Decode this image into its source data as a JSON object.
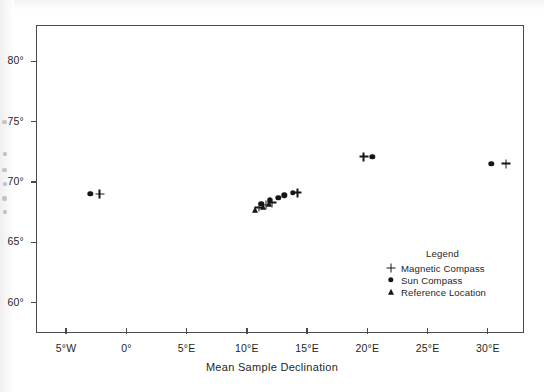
{
  "chart_data": {
    "type": "scatter",
    "title": "",
    "xlabel": "Mean Sample Declination",
    "ylabel": "",
    "xlim": [
      -7.5,
      33.0
    ],
    "ylim": [
      57.5,
      83.0
    ],
    "grid": false,
    "legend_position": "inside-lower-right",
    "x_ticks": [
      {
        "value": -5,
        "label": "5°W"
      },
      {
        "value": 0,
        "label": "0°"
      },
      {
        "value": 5,
        "label": "5°E"
      },
      {
        "value": 10,
        "label": "10°E"
      },
      {
        "value": 15,
        "label": "15°E"
      },
      {
        "value": 20,
        "label": "20°E"
      },
      {
        "value": 25,
        "label": "25°E"
      },
      {
        "value": 30,
        "label": "30°E"
      }
    ],
    "y_ticks": [
      {
        "value": 60,
        "label": "60°"
      },
      {
        "value": 65,
        "label": "65°"
      },
      {
        "value": 70,
        "label": "70°"
      },
      {
        "value": 75,
        "label": "75°"
      },
      {
        "value": 80,
        "label": "80°"
      }
    ],
    "series": [
      {
        "name": "Magnetic Compass",
        "marker": "plus",
        "color": "#161616",
        "points": [
          {
            "x": -2.2,
            "y": 69.0
          },
          {
            "x": 11.0,
            "y": 67.9
          },
          {
            "x": 11.6,
            "y": 68.1
          },
          {
            "x": 12.1,
            "y": 68.3
          },
          {
            "x": 14.2,
            "y": 69.1
          },
          {
            "x": 19.7,
            "y": 72.1
          },
          {
            "x": 31.5,
            "y": 71.5
          }
        ]
      },
      {
        "name": "Sun Compass",
        "marker": "circle",
        "color": "#161616",
        "points": [
          {
            "x": -3.0,
            "y": 69.0
          },
          {
            "x": 11.2,
            "y": 68.2
          },
          {
            "x": 11.9,
            "y": 68.5
          },
          {
            "x": 12.6,
            "y": 68.7
          },
          {
            "x": 13.1,
            "y": 68.9
          },
          {
            "x": 13.8,
            "y": 69.1
          },
          {
            "x": 20.4,
            "y": 72.1
          },
          {
            "x": 30.3,
            "y": 71.5
          }
        ]
      },
      {
        "name": "Reference Location",
        "marker": "triangle",
        "color": "#161616",
        "points": [
          {
            "x": 10.7,
            "y": 67.7
          },
          {
            "x": 11.3,
            "y": 67.9
          },
          {
            "x": 11.8,
            "y": 68.2
          }
        ]
      }
    ],
    "legend": {
      "title": "Legend",
      "entries": [
        {
          "marker": "plus",
          "label": "Magnetic Compass"
        },
        {
          "marker": "circle",
          "label": "Sun Compass"
        },
        {
          "marker": "triangle",
          "label": "Reference Location"
        }
      ]
    }
  }
}
